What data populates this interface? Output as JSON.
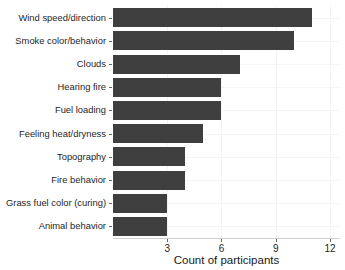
{
  "chart_data": {
    "type": "bar",
    "orientation": "horizontal",
    "title": "",
    "xlabel": "Count of participants",
    "ylabel": "",
    "categories": [
      "Wind speed/direction",
      "Smoke color/behavior",
      "Clouds",
      "Hearing fire",
      "Fuel loading",
      "Feeling heat/dryness",
      "Topography",
      "Fire behavior",
      "Grass fuel color (curing)",
      "Animal behavior"
    ],
    "values": [
      11,
      10,
      7,
      6,
      6,
      5,
      4,
      4,
      3,
      3
    ],
    "xlim": [
      0,
      12.5
    ],
    "xticks": [
      3,
      6,
      9,
      12
    ],
    "xticklabels": [
      "3",
      "6",
      "9",
      "12"
    ],
    "grid": true,
    "legend": null,
    "bar_color": "#3f3f3f",
    "panel_background": "#ffffff",
    "gridline_color": "#f4f4f4",
    "axis_color": "#666666"
  }
}
